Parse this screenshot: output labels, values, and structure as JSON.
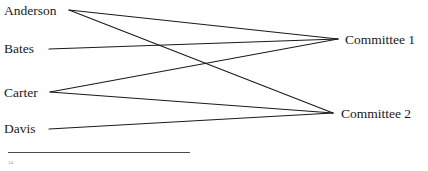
{
  "figure": {
    "kind": "bipartite-graph",
    "left_nodes": [
      {
        "id": "anderson",
        "label": "Anderson",
        "x": 4,
        "y": 4
      },
      {
        "id": "bates",
        "label": "Bates",
        "x": 4,
        "y": 42
      },
      {
        "id": "carter",
        "label": "Carter",
        "x": 4,
        "y": 86
      },
      {
        "id": "davis",
        "label": "Davis",
        "x": 4,
        "y": 122
      }
    ],
    "right_nodes": [
      {
        "id": "committee1",
        "label": "Committee 1",
        "x": 345,
        "y": 33
      },
      {
        "id": "committee2",
        "label": "Committee 2",
        "x": 341,
        "y": 107
      }
    ],
    "anchors": {
      "anderson": {
        "x": 69,
        "y": 10
      },
      "bates": {
        "x": 49,
        "y": 49
      },
      "carter": {
        "x": 50,
        "y": 92
      },
      "davis": {
        "x": 49,
        "y": 129
      },
      "committee1": {
        "x": 338,
        "y": 39
      },
      "committee2": {
        "x": 333,
        "y": 113
      }
    },
    "edges": [
      {
        "from": "anderson",
        "to": "committee1"
      },
      {
        "from": "anderson",
        "to": "committee2"
      },
      {
        "from": "bates",
        "to": "committee1"
      },
      {
        "from": "carter",
        "to": "committee1"
      },
      {
        "from": "carter",
        "to": "committee2"
      },
      {
        "from": "davis",
        "to": "committee2"
      }
    ],
    "edge_color": "#1a1a1a",
    "edge_width": 1.1
  },
  "footnote": {
    "rule_color": "#4a4a4a",
    "text": "14"
  }
}
